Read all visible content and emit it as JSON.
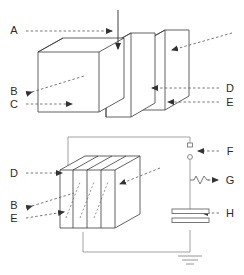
{
  "figure": {
    "type": "technical-line-diagram",
    "background_color": "#ffffff",
    "line_color": "#3a3a3a",
    "leader_color": "#555555",
    "label_color": "#2b2b2b",
    "panels": [
      {
        "id": "upper-panel",
        "name": "exploded-plate-assembly-view",
        "description": "Three separated rectangular plates shown in oblique projection with a vertical injection arrow entering the gap from above",
        "plate_count": 3
      },
      {
        "id": "lower-panel",
        "name": "assembled-plate-stack-with-circuit-view",
        "description": "Four stacked plates in oblique projection wired into a circuit containing a spark gap, a resistor and a capacitor referenced to ground",
        "plate_count": 4
      }
    ]
  },
  "upper_labels": [
    {
      "key": "A",
      "text": "A",
      "side": "left",
      "x": 14,
      "y": 34
    },
    {
      "key": "B",
      "text": "B",
      "side": "left",
      "x": 14,
      "y": 91
    },
    {
      "key": "C",
      "text": "C",
      "side": "left",
      "x": 14,
      "y": 107
    },
    {
      "key": "D",
      "text": "D",
      "side": "right",
      "x": 228,
      "y": 90
    },
    {
      "key": "E",
      "text": "E",
      "side": "right",
      "x": 228,
      "y": 104
    }
  ],
  "lower_labels": [
    {
      "key": "D",
      "text": "D",
      "side": "left",
      "x": 14,
      "y": 176
    },
    {
      "key": "B",
      "text": "B",
      "side": "left",
      "x": 14,
      "y": 205
    },
    {
      "key": "E",
      "text": "E",
      "side": "left",
      "x": 14,
      "y": 219
    },
    {
      "key": "F",
      "text": "F",
      "side": "right",
      "x": 228,
      "y": 153
    },
    {
      "key": "G",
      "text": "G",
      "side": "right",
      "x": 228,
      "y": 182
    },
    {
      "key": "H",
      "text": "H",
      "side": "right",
      "x": 228,
      "y": 215
    }
  ],
  "circuit": {
    "components": [
      {
        "id": "spark-gap",
        "label_key": "F",
        "name": "spark-gap-electrodes"
      },
      {
        "id": "resistor",
        "label_key": "G",
        "name": "resistor-zigzag"
      },
      {
        "id": "capacitor",
        "label_key": "H",
        "name": "capacitor-parallel-plates"
      },
      {
        "id": "ground",
        "label_key": "",
        "name": "earth-ground-symbol"
      }
    ]
  }
}
